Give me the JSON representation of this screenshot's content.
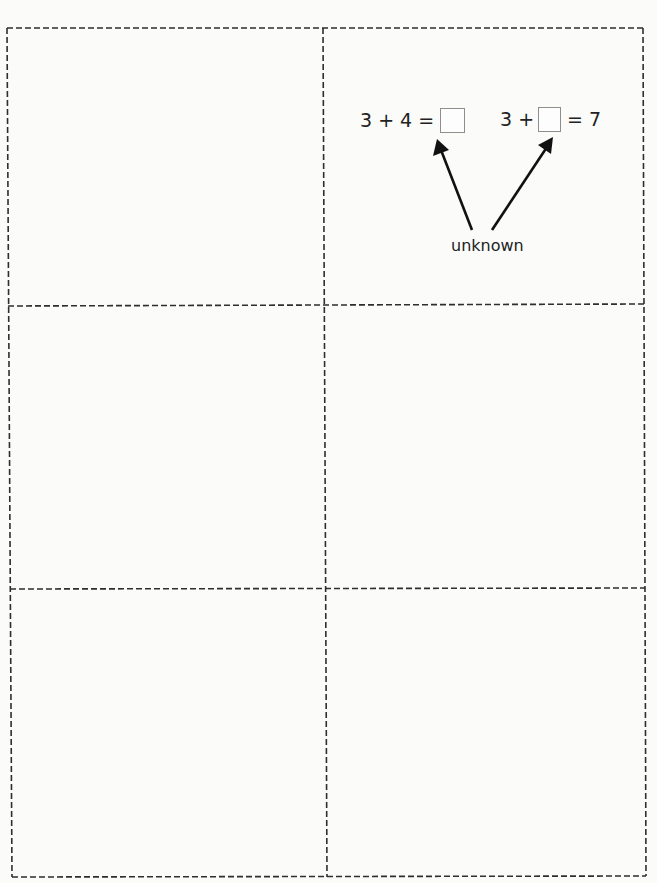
{
  "worksheet": {
    "layout": {
      "rows": 3,
      "columns": 2,
      "border_style": "dashed",
      "line_color": "#2e2e2e",
      "background": "#fbfbfa"
    },
    "cells": [
      {
        "row": 1,
        "col": 1,
        "content": ""
      },
      {
        "row": 1,
        "col": 2,
        "equations": [
          {
            "left": "3 + 4 =",
            "right": "",
            "box_position": "end"
          },
          {
            "left": "3 +",
            "right": "= 7",
            "box_position": "middle"
          }
        ],
        "label": "unknown",
        "arrows": [
          {
            "from": "label",
            "to": "equation-1-box"
          },
          {
            "from": "label",
            "to": "equation-2-box"
          }
        ]
      },
      {
        "row": 2,
        "col": 1,
        "content": ""
      },
      {
        "row": 2,
        "col": 2,
        "content": ""
      },
      {
        "row": 3,
        "col": 1,
        "content": ""
      },
      {
        "row": 3,
        "col": 2,
        "content": ""
      }
    ],
    "box_border_color": "#8e8e8e",
    "text_color": "#222222"
  }
}
